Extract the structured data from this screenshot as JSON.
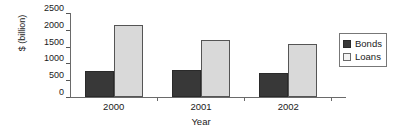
{
  "chart_data": {
    "type": "bar",
    "title": "",
    "subtitle": "",
    "xlabel": "Year",
    "ylabel": "$ (billion)",
    "categories": [
      "2000",
      "2001",
      "2002"
    ],
    "series": [
      {
        "name": "Bonds",
        "values": [
          780,
          810,
          710
        ],
        "color": "#383838"
      },
      {
        "name": "Loans",
        "values": [
          2150,
          1700,
          1580
        ],
        "color": "#d9d9d9"
      }
    ],
    "ylim": [
      0,
      2500
    ],
    "yticks": [
      0,
      500,
      1000,
      1500,
      2000,
      2500
    ],
    "ytick_labels": [
      "0",
      "500",
      "1000",
      "1500",
      "2000",
      "2500"
    ],
    "grid": false,
    "legend_position": "right",
    "legend_border": true
  },
  "legend": {
    "items": [
      {
        "label": "Bonds",
        "swatch": "bonds-swatch"
      },
      {
        "label": "Loans",
        "swatch": "loans-swatch"
      }
    ]
  },
  "axes": {
    "y_title": "$ (billion)",
    "x_title": "Year",
    "y_tick_labels": [
      "2500",
      "2000",
      "1500",
      "1000",
      "500",
      "0"
    ],
    "x_tick_labels": [
      "2000",
      "2001",
      "2002"
    ]
  }
}
